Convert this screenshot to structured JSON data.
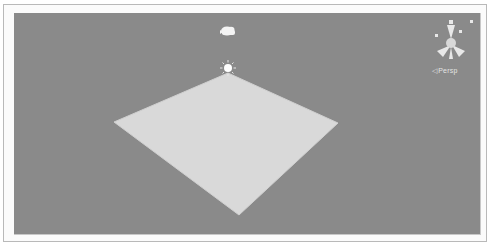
{
  "scene_view": {
    "background_color": "#8a8a8a",
    "plane_color": "#d9d9d9",
    "objects": [
      {
        "type": "plane",
        "name": "Plane"
      },
      {
        "type": "camera",
        "icon": "camera-icon"
      },
      {
        "type": "light",
        "icon": "directional-light-icon"
      }
    ]
  },
  "gizmo": {
    "projection_label": "Persp",
    "projection_arrow": "◁",
    "icon": "scene-orientation-gizmo-icon"
  }
}
